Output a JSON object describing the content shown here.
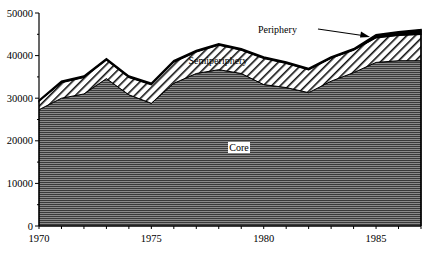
{
  "chart_data": {
    "type": "area",
    "stacked": true,
    "title": "",
    "xlabel": "",
    "ylabel": "",
    "x": [
      1970,
      1971,
      1972,
      1973,
      1974,
      1975,
      1976,
      1977,
      1978,
      1979,
      1980,
      1981,
      1982,
      1983,
      1984,
      1985,
      1986,
      1987
    ],
    "series": [
      {
        "name": "Core",
        "fill": "horizontal-lines",
        "values": [
          27300,
          30000,
          31000,
          34600,
          30800,
          28800,
          33500,
          35800,
          36700,
          35800,
          33200,
          32500,
          31300,
          34000,
          36000,
          38400,
          38800,
          38800
        ]
      },
      {
        "name": "Semiperiphery",
        "fill": "diagonal-hatch",
        "values": [
          2000,
          3700,
          3900,
          4400,
          4100,
          4400,
          5000,
          5100,
          5800,
          5500,
          6200,
          5700,
          5400,
          5400,
          5300,
          5800,
          6000,
          6200
        ]
      },
      {
        "name": "Periphery",
        "fill": "solid-black",
        "values": [
          200,
          300,
          300,
          300,
          300,
          300,
          300,
          300,
          300,
          300,
          300,
          300,
          300,
          300,
          300,
          700,
          800,
          1100
        ]
      }
    ],
    "xlim": [
      1970,
      1987
    ],
    "ylim": [
      0,
      50000
    ],
    "x_ticks": [
      "1970",
      "1975",
      "1980",
      "1985"
    ],
    "y_ticks": [
      "0",
      "10000",
      "20000",
      "30000",
      "40000",
      "50000"
    ],
    "grid": false,
    "annotations": [
      {
        "text": "Core",
        "x": 1978.5,
        "y": 18000
      },
      {
        "text": "Semiperiphery",
        "x": 1978.5,
        "y": 39000
      },
      {
        "text": "Periphery",
        "x": 1980,
        "y": 46500,
        "arrow_to": [
          1984.8,
          44500
        ]
      }
    ]
  }
}
